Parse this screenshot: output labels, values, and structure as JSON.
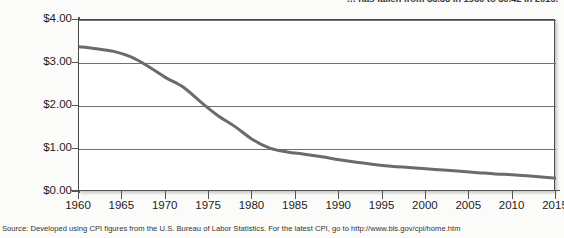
{
  "caption": {
    "clipped_text": "… has fallen from $3.38 in 1960 to $0.42 in 2015."
  },
  "source": {
    "text": "Source: Developed using CPI figures from the U.S. Bureau of Labor Statistics. For the latest CPI, go to http://www.bls.gov/cpi/home.htm"
  },
  "colors": {
    "line": "#6b6b6b",
    "grid": "#6f6f6f",
    "axis": "#555555",
    "plot_background": "#ffffff",
    "page_background": "#fbfbfa"
  },
  "chart_data": {
    "type": "line",
    "title": "",
    "xlabel": "",
    "ylabel": "",
    "xlim": [
      1960,
      2015
    ],
    "ylim": [
      0.0,
      4.0
    ],
    "grid": true,
    "legend": "none",
    "y_ticks": [
      0.0,
      1.0,
      2.0,
      3.0,
      4.0
    ],
    "y_tick_labels": [
      "$0.00",
      "$1.00",
      "$2.00",
      "$3.00",
      "$4.00"
    ],
    "x_ticks": [
      1960,
      1965,
      1970,
      1975,
      1980,
      1985,
      1990,
      1995,
      2000,
      2005,
      2010,
      2015
    ],
    "x_tick_labels": [
      "1960",
      "1965",
      "1970",
      "1975",
      "1980",
      "1985",
      "1990",
      "1995",
      "2000",
      "2005",
      "2010",
      "2015"
    ],
    "series": [
      {
        "name": "Value of the dollar",
        "x": [
          1960,
          1962,
          1964,
          1966,
          1968,
          1970,
          1972,
          1974,
          1976,
          1978,
          1980,
          1982,
          1984,
          1986,
          1988,
          1990,
          1992,
          1994,
          1996,
          1998,
          2000,
          2002,
          2004,
          2006,
          2008,
          2010,
          2012,
          2015
        ],
        "values": [
          3.38,
          3.33,
          3.27,
          3.14,
          2.92,
          2.66,
          2.44,
          2.1,
          1.78,
          1.52,
          1.22,
          1.02,
          0.93,
          0.88,
          0.82,
          0.75,
          0.69,
          0.64,
          0.6,
          0.57,
          0.54,
          0.51,
          0.48,
          0.45,
          0.42,
          0.4,
          0.37,
          0.32
        ]
      }
    ]
  }
}
